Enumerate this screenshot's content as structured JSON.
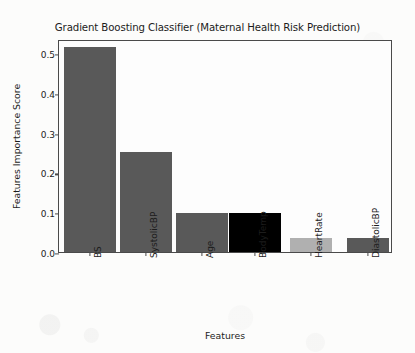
{
  "chart_data": {
    "type": "bar",
    "title": "Gradient Boosting Classifier (Maternal Health Risk Prediction)",
    "xlabel": "Features",
    "ylabel": "Features Importance Score",
    "categories": [
      "BS",
      "SystolicBP",
      "Age",
      "BodyTemp",
      "HeartRate",
      "DiastolicBP"
    ],
    "values": [
      0.515,
      0.251,
      0.098,
      0.098,
      0.036,
      0.036
    ],
    "bar_colors": [
      "#595959",
      "#595959",
      "#595959",
      "#000000",
      "#b0b0b0",
      "#595959"
    ],
    "ylim": [
      0.0,
      0.535
    ],
    "yticks": [
      0.0,
      0.1,
      0.2,
      0.3,
      0.4,
      0.5
    ],
    "ytick_labels": [
      "0.0",
      "0.1",
      "0.2",
      "0.3",
      "0.4",
      "0.5"
    ],
    "grid": false,
    "legend": "none"
  },
  "figure": {
    "background_color": "#fcfcfb",
    "axes_color": "#4a4a4a",
    "text_color": "#1c1c1c"
  }
}
